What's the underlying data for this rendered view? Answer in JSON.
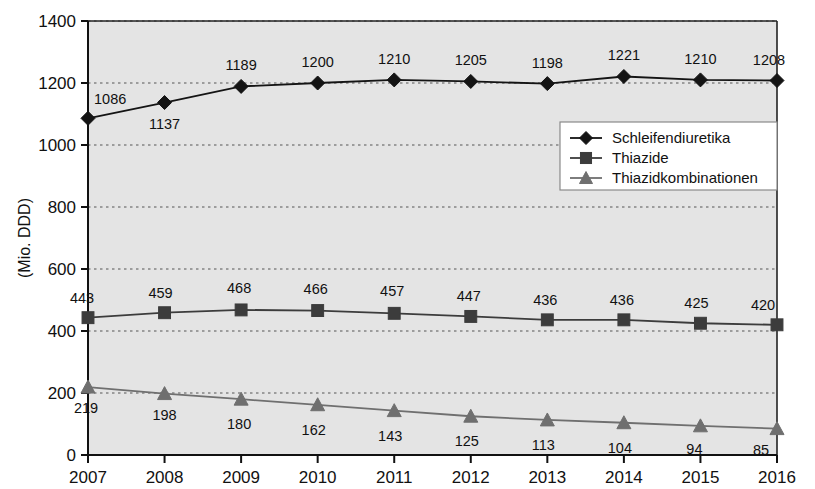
{
  "chart_data": {
    "type": "line",
    "title": "",
    "xlabel": "",
    "ylabel": "(Mio. DDD)",
    "categories": [
      "2007",
      "2008",
      "2009",
      "2010",
      "2011",
      "2012",
      "2013",
      "2014",
      "2015",
      "2016"
    ],
    "x": [
      2007,
      2008,
      2009,
      2010,
      2011,
      2012,
      2013,
      2014,
      2015,
      2016
    ],
    "ylim": [
      0,
      1400
    ],
    "yticks": [
      0,
      200,
      400,
      600,
      800,
      1000,
      1200,
      1400
    ],
    "ytick_labels": [
      "0",
      "200",
      "400",
      "600",
      "800",
      "1000",
      "1200",
      "1400"
    ],
    "grid": "horizontal-dotted",
    "legend_position": "center-right",
    "plot_background": "#e4e4e4",
    "series": [
      {
        "name": "Schleifendiuretika",
        "marker": "diamond",
        "color": "#141414",
        "values": [
          1086,
          1137,
          1189,
          1200,
          1210,
          1205,
          1198,
          1221,
          1210,
          1208
        ],
        "labels": [
          "1086",
          "1137",
          "1189",
          "1200",
          "1210",
          "1205",
          "1198",
          "1221",
          "1210",
          "1208"
        ]
      },
      {
        "name": "Thiazide",
        "marker": "square",
        "color": "#3c3c3c",
        "values": [
          443,
          459,
          468,
          466,
          457,
          447,
          436,
          436,
          425,
          420
        ],
        "labels": [
          "443",
          "459",
          "468",
          "466",
          "457",
          "447",
          "436",
          "436",
          "425",
          "420"
        ]
      },
      {
        "name": "Thiazidkombinationen",
        "marker": "triangle",
        "color": "#6f6f6f",
        "values": [
          219,
          198,
          180,
          162,
          143,
          125,
          113,
          104,
          94,
          85
        ],
        "labels": [
          "219",
          "198",
          "180",
          "162",
          "143",
          "125",
          "113",
          "104",
          "94",
          "85"
        ]
      }
    ]
  },
  "legend": {
    "entries": [
      {
        "label": "Schleifendiuretika"
      },
      {
        "label": "Thiazide"
      },
      {
        "label": "Thiazidkombinationen"
      }
    ]
  },
  "axes": {
    "y_title": "(Mio. DDD)"
  }
}
